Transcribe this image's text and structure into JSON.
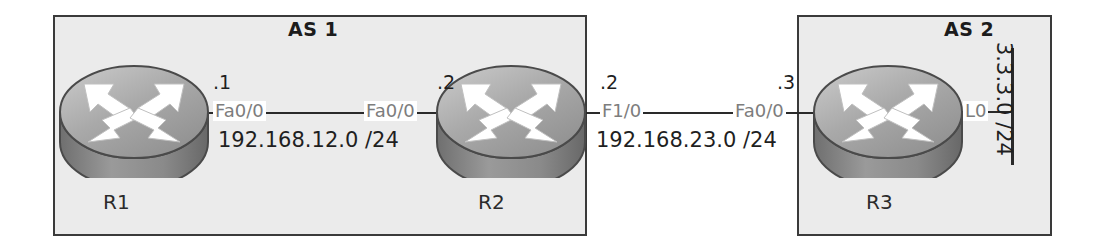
{
  "diagram": {
    "colors": {
      "page_background": "#ffffff",
      "as_box_fill": "#ebebeb",
      "as_box_border": "#3a3a3a",
      "link_line": "#2a2a2a",
      "interface_text": "#7d7d7d",
      "label_text": "#1f1f1f",
      "router_body_light": "#d8d8d8",
      "router_body_dark": "#7c7c7c",
      "router_arrow": "#ffffff"
    }
  },
  "autonomous_systems": [
    {
      "id": "as1",
      "label": "AS 1"
    },
    {
      "id": "as2",
      "label": "AS 2"
    }
  ],
  "routers": [
    {
      "id": "r1",
      "name": "R1",
      "icon": "router-icon",
      "as": "AS 1"
    },
    {
      "id": "r2",
      "name": "R2",
      "icon": "router-icon",
      "as": "AS 1"
    },
    {
      "id": "r3",
      "name": "R3",
      "icon": "router-icon",
      "as": "AS 2"
    }
  ],
  "links": [
    {
      "id": "link-12",
      "subnet": "192.168.12.0 /24",
      "endpoints": [
        {
          "router": "R1",
          "interface": "Fa0/0",
          "host_octet": ".1"
        },
        {
          "router": "R2",
          "interface": "Fa0/0",
          "host_octet": ".2"
        }
      ]
    },
    {
      "id": "link-23",
      "subnet": "192.168.23.0 /24",
      "endpoints": [
        {
          "router": "R2",
          "interface": "F1/0",
          "host_octet": ".2"
        },
        {
          "router": "R3",
          "interface": "Fa0/0",
          "host_octet": ".3"
        }
      ]
    },
    {
      "id": "link-lo",
      "subnet": "3.3.3.0 /24",
      "orientation": "vertical",
      "endpoints": [
        {
          "router": "R3",
          "interface": "L0",
          "host_octet": ""
        }
      ]
    }
  ]
}
